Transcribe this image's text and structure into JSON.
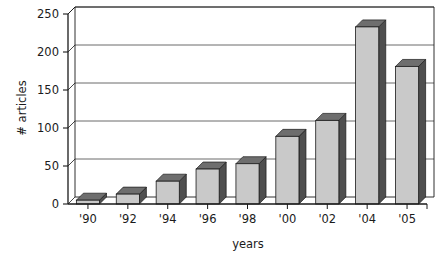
{
  "chart_data": {
    "type": "bar",
    "title": "",
    "subtitle": "",
    "xlabel": "years",
    "ylabel": "# articles",
    "categories": [
      "'90",
      "'92",
      "'94",
      "'96",
      "'98",
      "'00",
      "'02",
      "'04",
      "'05"
    ],
    "values": [
      5,
      13,
      30,
      46,
      53,
      89,
      110,
      233,
      181
    ],
    "series": [
      {
        "name": "# articles",
        "values": [
          5,
          13,
          30,
          46,
          53,
          89,
          110,
          233,
          181
        ]
      }
    ],
    "ylim": [
      0,
      250
    ],
    "yticks": [
      0,
      50,
      100,
      150,
      200,
      250
    ],
    "ytick_labels": [
      "0",
      "50",
      "100",
      "150",
      "200",
      "250"
    ],
    "xtick_labels": [
      "'90",
      "'92",
      "'94",
      "'96",
      "'98",
      "'00",
      "'02",
      "'04",
      "'05"
    ],
    "grid": "horizontal",
    "legend": "none",
    "annotations": [],
    "style": {
      "bar_face_color": "#c9c9c9",
      "bar_side_color": "#4f4f4f",
      "bar_top_color": "#6e6e6e",
      "bar_outline_color": "#1a1a1a",
      "axis_color": "#1a1a1a",
      "grid_color": "#5a5a5a",
      "background_color": "#ffffff",
      "text_color": "#1b1b1b",
      "three_d": true
    }
  },
  "axes": {
    "y_title": "# articles",
    "x_title": "years",
    "y_ticks": [
      {
        "label": "250",
        "value": 250
      },
      {
        "label": "200",
        "value": 200
      },
      {
        "label": "150",
        "value": 150
      },
      {
        "label": "100",
        "value": 100
      },
      {
        "label": "50",
        "value": 50
      },
      {
        "label": "0",
        "value": 0
      }
    ],
    "x_ticks": [
      {
        "label": "'90"
      },
      {
        "label": "'92"
      },
      {
        "label": "'94"
      },
      {
        "label": "'96"
      },
      {
        "label": "'98"
      },
      {
        "label": "'00"
      },
      {
        "label": "'02"
      },
      {
        "label": "'04"
      },
      {
        "label": "'05"
      }
    ]
  }
}
